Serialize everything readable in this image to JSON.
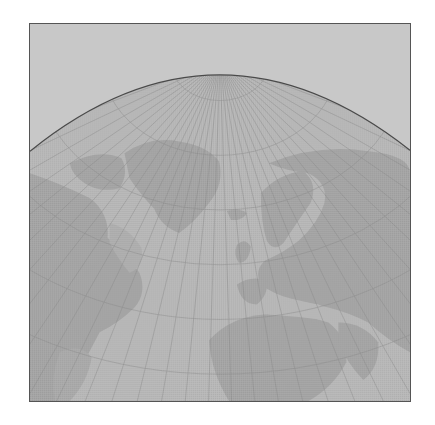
{
  "map": {
    "projection": "azimuthal-perspective-north-polar",
    "region": "North Atlantic / Northern Hemisphere",
    "colors": {
      "page_background": "#ffffff",
      "frame_border": "#555555",
      "space": "#c8c8c8",
      "ocean": "#b8b8b8",
      "land": "#a5a5a5",
      "land_light": "#afafaf",
      "graticule": "#8a8a8a",
      "limb": "#4a4a4a"
    },
    "frame": {
      "x": 29,
      "y": 23,
      "width": 382,
      "height": 379
    },
    "horizon_arc": {
      "left_y": 151,
      "peak_x": 218,
      "peak_y": 76,
      "right_y": 150
    },
    "pole": {
      "x": 220,
      "y": 60
    },
    "meridian_count": 36,
    "parallels": [
      {
        "label": "80N",
        "radius": 40
      },
      {
        "label": "70N",
        "radius": 95
      },
      {
        "label": "60N",
        "radius": 150
      },
      {
        "label": "50N",
        "radius": 205
      },
      {
        "label": "40N",
        "radius": 260
      },
      {
        "label": "30N",
        "radius": 315
      }
    ],
    "landmasses": [
      {
        "name": "Greenland"
      },
      {
        "name": "North America"
      },
      {
        "name": "Iceland"
      },
      {
        "name": "Scandinavia"
      },
      {
        "name": "Europe"
      },
      {
        "name": "Asia"
      },
      {
        "name": "North Africa"
      },
      {
        "name": "Arabian Peninsula"
      }
    ]
  }
}
